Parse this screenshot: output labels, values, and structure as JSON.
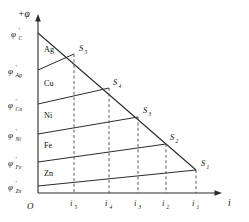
{
  "figure": {
    "title": "",
    "axes": {
      "y_axis_label": "+φ",
      "x_axis_label": "i",
      "origin_label": "O"
    },
    "potential_labels": [
      {
        "base": "φ",
        "prime": "′",
        "sub": "C",
        "y": 33
      },
      {
        "base": "φ",
        "prime": "′",
        "sub": "Ag",
        "y": 70
      },
      {
        "base": "φ",
        "prime": "′",
        "sub": "Cu",
        "y": 104
      },
      {
        "base": "φ",
        "prime": "′",
        "sub": "Ni",
        "y": 134
      },
      {
        "base": "φ",
        "prime": "′",
        "sub": "Fe",
        "y": 162
      },
      {
        "base": "φ",
        "prime": "′",
        "sub": "Zn",
        "y": 186
      }
    ],
    "metal_bands": [
      {
        "name": "Ag",
        "x": 44,
        "y": 52
      },
      {
        "name": "Cu",
        "x": 44,
        "y": 86
      },
      {
        "name": "Ni",
        "x": 44,
        "y": 118
      },
      {
        "name": "Fe",
        "x": 44,
        "y": 148
      },
      {
        "name": "Zn",
        "x": 44,
        "y": 176
      }
    ],
    "intersection_points": [
      {
        "main": "S",
        "sub": "5",
        "px": 74,
        "py": 54,
        "lx": 79,
        "ly": 51
      },
      {
        "main": "S",
        "sub": "4",
        "px": 109,
        "py": 88,
        "lx": 113,
        "ly": 85
      },
      {
        "main": "S",
        "sub": "3",
        "px": 138,
        "py": 117,
        "lx": 143,
        "ly": 113
      },
      {
        "main": "S",
        "sub": "2",
        "px": 166,
        "py": 144,
        "lx": 170,
        "ly": 140
      },
      {
        "main": "S",
        "sub": "1",
        "px": 196,
        "py": 170,
        "lx": 201,
        "ly": 166
      }
    ],
    "current_ticks": [
      {
        "main": "i",
        "sub": "5",
        "x": 74,
        "label_x": 71,
        "label_y": 205
      },
      {
        "main": "i",
        "sub": "4",
        "x": 109,
        "label_x": 106,
        "label_y": 205
      },
      {
        "main": "i",
        "sub": "3",
        "x": 138,
        "label_x": 135,
        "label_y": 205
      },
      {
        "main": "i",
        "sub": "2",
        "x": 166,
        "label_x": 163,
        "label_y": 205
      },
      {
        "main": "i",
        "sub": "1",
        "x": 196,
        "label_x": 193,
        "label_y": 205
      }
    ],
    "geometry": {
      "origin_x": 38,
      "origin_y": 193,
      "y_axis_top": 18,
      "x_axis_right": 222,
      "cathode_start_y": 33,
      "envelope_end_x": 196,
      "envelope_end_y": 170
    },
    "colors": {
      "stroke": "#2b2b2b",
      "dashed": "#4a4a4a",
      "text": "#111111",
      "background": "#ffffff"
    }
  }
}
